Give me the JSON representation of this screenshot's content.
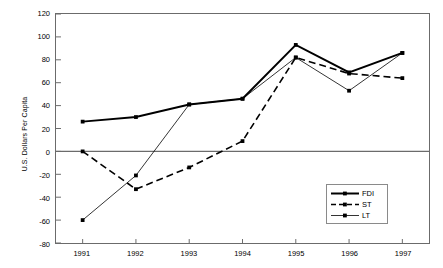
{
  "chart_data": {
    "type": "line",
    "title": "",
    "xlabel": "",
    "ylabel": "U.S. Dollars Per Capita",
    "categories": [
      "1991",
      "1992",
      "1993",
      "1994",
      "1995",
      "1996",
      "1997"
    ],
    "x": [
      1991,
      1992,
      1993,
      1994,
      1995,
      1996,
      1997
    ],
    "ylim": [
      -80,
      120
    ],
    "yticks": [
      120,
      100,
      80,
      60,
      40,
      20,
      0,
      -20,
      -40,
      -60,
      -80
    ],
    "ytick_labels": [
      "120",
      "100",
      "80",
      "60",
      "40",
      "20",
      "0",
      "-20",
      "-40",
      "-60",
      "-80"
    ],
    "grid": false,
    "legend_position": "inside-bottom-right",
    "zero_line": 0,
    "series": [
      {
        "name": "FDI",
        "style": "solid-thick",
        "marker": "square",
        "values": [
          26,
          30,
          41,
          46,
          93,
          69,
          86
        ]
      },
      {
        "name": "ST",
        "style": "dashed",
        "marker": "square",
        "values": [
          0,
          -33,
          -14,
          9,
          82,
          68,
          64
        ]
      },
      {
        "name": "LT",
        "style": "solid-thin",
        "marker": "square",
        "values": [
          -60,
          -21,
          41,
          46,
          82,
          53,
          86
        ]
      }
    ]
  },
  "legend": {
    "items": [
      {
        "label": "FDI",
        "sample": "solid-thick-line-with-marker"
      },
      {
        "label": "ST",
        "sample": "dashed-line-with-marker"
      },
      {
        "label": "LT",
        "sample": "thin-line-with-marker"
      }
    ]
  }
}
